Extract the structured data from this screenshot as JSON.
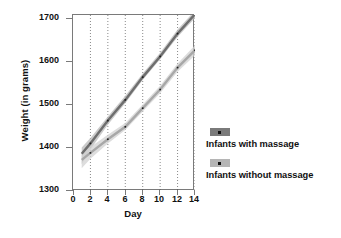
{
  "chart_data": {
    "type": "line",
    "title": "",
    "xlabel": "Day",
    "ylabel": "Weight (in grams)",
    "xlim": [
      0,
      14
    ],
    "ylim": [
      1300,
      1725
    ],
    "xticks": [
      0,
      2,
      4,
      6,
      8,
      10,
      12,
      14
    ],
    "yticks": [
      1300,
      1400,
      1500,
      1600,
      1700
    ],
    "grid": "vertical dotted gridlines at even days 2-14",
    "legend_position": "right",
    "series": [
      {
        "name": "Infants with massage",
        "color": "#6e6e6e",
        "band_color": "#b9b9b9",
        "x": [
          1,
          2,
          4,
          6,
          8,
          10,
          12,
          14
        ],
        "values": [
          1390,
          1415,
          1470,
          1520,
          1575,
          1625,
          1680,
          1727
        ],
        "band_low": [
          1365,
          1400,
          1460,
          1512,
          1568,
          1618,
          1672,
          1718
        ],
        "band_high": [
          1405,
          1428,
          1480,
          1530,
          1584,
          1634,
          1690,
          1736
        ]
      },
      {
        "name": "Infants without massage",
        "color": "#a8a8a8",
        "band_color": "#d2d2d2",
        "x": [
          1,
          2,
          4,
          6,
          8,
          10,
          12,
          14
        ],
        "values": [
          1375,
          1392,
          1425,
          1455,
          1500,
          1545,
          1598,
          1640
        ],
        "band_low": [
          1355,
          1378,
          1415,
          1447,
          1492,
          1536,
          1588,
          1628
        ],
        "band_high": [
          1392,
          1406,
          1436,
          1464,
          1509,
          1554,
          1608,
          1652
        ]
      }
    ]
  },
  "axis": {
    "y_title": "Weight (in grams)",
    "x_title": "Day",
    "y_tick_labels": [
      "1700",
      "1600",
      "1500",
      "1400",
      "1300"
    ],
    "x_tick_labels": [
      "0",
      "2",
      "4",
      "6",
      "8",
      "10",
      "12",
      "14"
    ]
  },
  "legend": {
    "items": [
      {
        "label": "Infants with massage",
        "color": "#7a7a7a",
        "marker": "square-marker"
      },
      {
        "label": "Infants without massage",
        "color": "#b5b5b5",
        "marker": "square-marker"
      }
    ]
  }
}
